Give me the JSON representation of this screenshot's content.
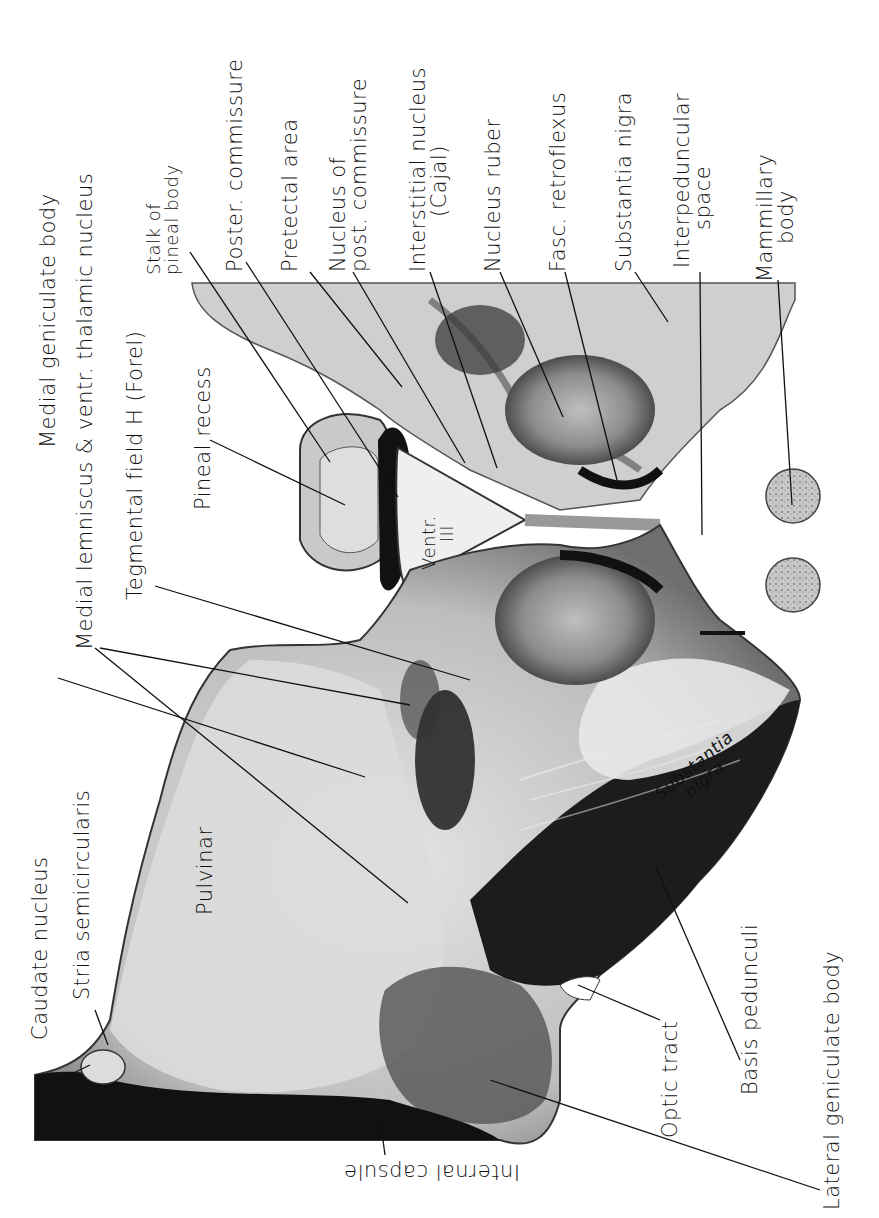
{
  "figure": {
    "orientation": "labels read bottom-to-top",
    "colors": {
      "background": "#ffffff",
      "tissue_light": "#d9d9d9",
      "tissue_mid": "#8a8a8a",
      "tissue_dark": "#1a1a1a",
      "ink": "#111111"
    }
  },
  "labels": {
    "top": [
      {
        "id": "medial-geniculate-body",
        "text": "Medial geniculate body",
        "x": 52,
        "y": 440,
        "target": [
          410,
          705
        ]
      },
      {
        "id": "medial-lemniscus",
        "text": "Medial lemniscus & ventr. thalamic nucleus",
        "x": 92,
        "y": 360,
        "target": [
          365,
          777
        ]
      },
      {
        "id": "tegmental-field",
        "text": "Tegmental field H (Forel)",
        "x": 128,
        "y": 313,
        "target": [
          470,
          680
        ]
      },
      {
        "id": "pineal-recess",
        "text": "Pineal recess",
        "x": 194,
        "y": 253,
        "target": [
          345,
          505
        ]
      },
      {
        "id": "stalk-of-pineal-body",
        "line1": "Stalk of",
        "line2": "pineal body",
        "x": 145,
        "y": 245,
        "target": [
          330,
          460
        ]
      },
      {
        "id": "poster-commissure",
        "text": "Poster. commissure",
        "x": 232,
        "y": 270,
        "target": [
          395,
          497
        ]
      },
      {
        "id": "pretectal-area",
        "text": "Pretectal area",
        "x": 286,
        "y": 270,
        "target": [
          400,
          385
        ]
      },
      {
        "id": "nucleus-of-post-commissure",
        "line1": "Nucleus of",
        "line2": "post. commissure",
        "x": 330,
        "y": 270,
        "target": [
          465,
          465
        ]
      },
      {
        "id": "interstitial-nucleus",
        "line1": "Interstitial nucleus",
        "line2": "(Cajal)",
        "x": 410,
        "y": 270,
        "target": [
          497,
          470
        ]
      },
      {
        "id": "nucleus-ruber",
        "text": "Nucleus ruber",
        "x": 487,
        "y": 270,
        "target": [
          565,
          415
        ]
      },
      {
        "id": "fasc-retroflexus",
        "text": "Fasc. retroflexus",
        "x": 553,
        "y": 270,
        "target": [
          615,
          482
        ]
      },
      {
        "id": "substantia-nigra-top",
        "text": "Substantia nigra",
        "x": 620,
        "y": 270,
        "target": [
          670,
          322
        ]
      },
      {
        "id": "interpeduncular-space",
        "line1": "Interpeduncular",
        "line2": "space",
        "x": 678,
        "y": 265,
        "target": [
          700,
          535
        ]
      },
      {
        "id": "mammillary-body",
        "line1": "Mammillary",
        "line2": "body",
        "x": 760,
        "y": 280,
        "target": [
          790,
          505
        ]
      }
    ],
    "bottom": [
      {
        "id": "caudate-nucleus",
        "text": "Caudate nucleus",
        "x": 35,
        "y": 1020,
        "target": [
          90,
          1065
        ]
      },
      {
        "id": "stria-semicircularis",
        "text": "Stria semicircularis",
        "x": 78,
        "y": 980,
        "target": [
          108,
          1010
        ]
      },
      {
        "id": "pulvinar",
        "text": "Pulvinar",
        "x": 198,
        "y": 920
      },
      {
        "id": "lateral-geniculate-body",
        "text": "Lateral geniculate body",
        "x": 828,
        "y": 1205,
        "target": [
          490,
          1080
        ]
      },
      {
        "id": "basis-pedunculi",
        "text": "Basis pedunculi",
        "x": 740,
        "y": 1093,
        "target": [
          655,
          865
        ]
      },
      {
        "id": "optic-tract",
        "text": "Optic tract",
        "x": 658,
        "y": 1135,
        "target": [
          575,
          985
        ]
      },
      {
        "id": "internal-capsule",
        "text": "Internal capsule",
        "x": 520,
        "y": 1180,
        "target": [
          380,
          1118
        ]
      }
    ],
    "inside": [
      {
        "id": "ventr-iii",
        "line1": "Ventr.",
        "line2": "III",
        "x": 432,
        "y": 545
      },
      {
        "id": "substantia-nigra-inner",
        "line1": "Substantia",
        "line2": "nigra",
        "x": 660,
        "y": 745
      }
    ]
  }
}
